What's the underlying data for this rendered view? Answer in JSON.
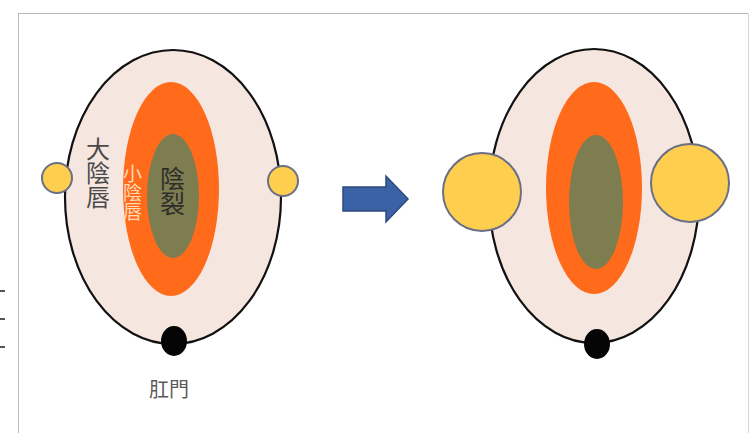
{
  "diagram": {
    "type": "before-after anatomical schematic",
    "left_panel": {
      "labels": {
        "outer": "大陰唇",
        "inner": "小陰唇",
        "center": "陰裂",
        "bottom": "肛門"
      },
      "side_circles": "small"
    },
    "arrow": {
      "direction": "right",
      "icon": "arrow-right-icon"
    },
    "right_panel": {
      "labels": {},
      "side_circles": "enlarged"
    },
    "colors": {
      "outer_fill": "#f5e6df",
      "outer_stroke": "#111111",
      "middle_fill": "#ff6b1a",
      "center_fill": "#7e7d4f",
      "side_circle_fill": "#fece4e",
      "side_circle_stroke": "#6b6f85",
      "anus_fill": "#050505",
      "arrow_fill": "#3c62a6",
      "arrow_stroke": "#2c4a80",
      "frame": "#b9b9b9"
    }
  }
}
